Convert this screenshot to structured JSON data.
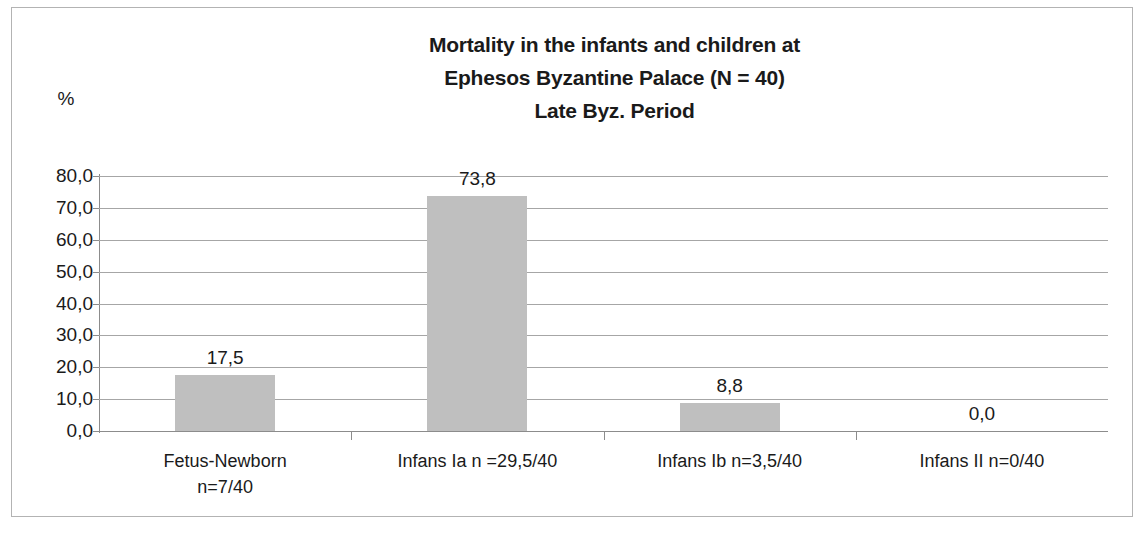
{
  "chart_data": {
    "type": "bar",
    "title": "Mortality in the infants and children at Ephesos Byzantine Palace (N = 40) Late Byz. Period",
    "title_lines": [
      "Mortality in the infants and children at",
      "Ephesos Byzantine Palace (N = 40)",
      "Late Byz. Period"
    ],
    "xlabel": "",
    "ylabel": "%",
    "categories": [
      "Fetus-Newborn n=7/40",
      "Infans Ia n =29,5/40",
      "Infans Ib n=3,5/40",
      "Infans II n=0/40"
    ],
    "category_lines": [
      [
        "Fetus-Newborn",
        "n=7/40"
      ],
      [
        "Infans Ia n =29,5/40"
      ],
      [
        "Infans Ib n=3,5/40"
      ],
      [
        "Infans II n=0/40"
      ]
    ],
    "values": [
      17.5,
      73.8,
      8.8,
      0.0
    ],
    "value_labels": [
      "17,5",
      "73,8",
      "8,8",
      "0,0"
    ],
    "ylim": [
      0,
      80
    ],
    "ytick_values": [
      80,
      70,
      60,
      50,
      40,
      30,
      20,
      10,
      0
    ],
    "ytick_labels": [
      "80,0",
      "70,0",
      "60,0",
      "50,0",
      "40,0",
      "30,0",
      "20,0",
      "10,0",
      "0,0"
    ],
    "grid": true,
    "legend": "none",
    "bar_color": "#bfbfbf",
    "gridline_color": "#a6a6a6",
    "axis_color": "#8c8c8c",
    "text_color": "#1a1a1a",
    "decimal_separator": ","
  }
}
